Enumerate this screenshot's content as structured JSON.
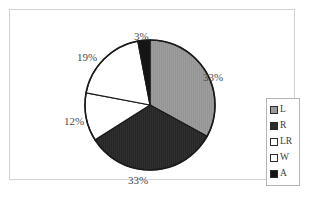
{
  "figure": {
    "background_color": "#ffffff",
    "frame_border_color": "#d3d3d3"
  },
  "legend": {
    "position": "right",
    "border_color": "#b4b4b4",
    "entries": [
      {
        "label": "L",
        "color": "#9a9a9a"
      },
      {
        "label": "R",
        "color": "#2e2e2e"
      },
      {
        "label": "LR",
        "color": "#ffffff"
      },
      {
        "label": "W",
        "color": "#ffffff"
      },
      {
        "label": "A",
        "color": "#151515"
      }
    ]
  },
  "chart_data": {
    "type": "pie",
    "title": "",
    "labels": [
      "L",
      "R",
      "LR",
      "W",
      "A"
    ],
    "values": [
      33,
      33,
      12,
      19,
      3
    ],
    "value_unit": "%",
    "data_labels": [
      "33%",
      "33%",
      "12%",
      "19%",
      "3%"
    ],
    "colors": [
      "#9a9a9a",
      "#2e2e2e",
      "#ffffff",
      "#ffffff",
      "#151515"
    ],
    "start_angle_deg": 0,
    "direction": "clockwise",
    "slice_edge_color": "#1a1a1a",
    "legend_position": "right",
    "grid": false
  }
}
